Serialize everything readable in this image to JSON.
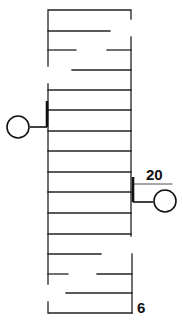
{
  "diagram": {
    "type": "stair-plan",
    "labels": {
      "top_step": "20",
      "bottom_step": "6"
    },
    "colors": {
      "stroke": "#222222",
      "background": "#ffffff"
    },
    "landings": [
      {
        "name": "upper-left-landing",
        "side": "left"
      },
      {
        "name": "lower-right-landing",
        "side": "right"
      }
    ],
    "treads_full_width_count": 8
  }
}
